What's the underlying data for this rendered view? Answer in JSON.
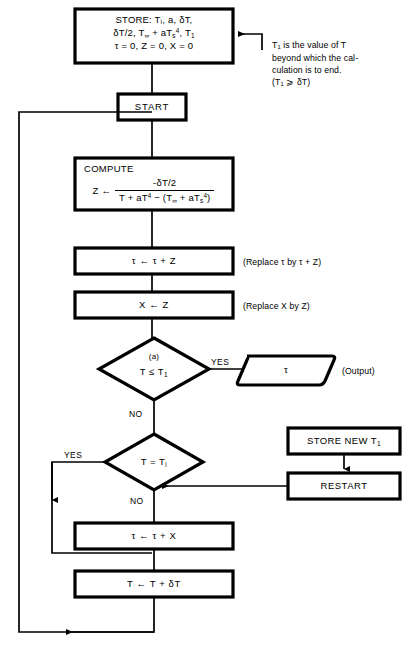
{
  "diagram": {
    "line_color": "#000000",
    "background": "#ffffff"
  },
  "nodes": {
    "store": {
      "shape": "process",
      "line1": "STORE:  Tᵢ, a, δT,",
      "line2_a": "δT/2, T",
      "line2_sub": "∞",
      "line2_b": " + aT",
      "line2_sub2": "s",
      "line2_sup": "4",
      "line2_c": ", T",
      "line2_sub3": "1",
      "line3": "τ = 0, Z = 0, X = 0"
    },
    "start": {
      "shape": "process",
      "label": "START"
    },
    "compute": {
      "shape": "process",
      "label": "COMPUTE",
      "assign_var": "Z",
      "assign_arrow": "←",
      "numerator": "-δT/2",
      "denominator_a": "T + aT",
      "denominator_sup1": "4",
      "denominator_b": " − (T",
      "denominator_sub1": "∞",
      "denominator_c": " + aT",
      "denominator_sub2": "s",
      "denominator_sup2": "4",
      "denominator_d": ")"
    },
    "tau_update": {
      "shape": "process",
      "label": "τ ← τ + Z"
    },
    "x_update": {
      "shape": "process",
      "label": "X ← Z"
    },
    "decision_a": {
      "shape": "decision",
      "marker": "(a)",
      "label_a": "T ≤ T",
      "label_sub": "1"
    },
    "output_tau": {
      "shape": "data",
      "label": "τ"
    },
    "decision_b": {
      "shape": "decision",
      "label_a": "T = T",
      "label_sub": "i"
    },
    "store_new": {
      "shape": "process",
      "label_a": "STORE NEW T",
      "label_sub": "1"
    },
    "restart": {
      "shape": "process",
      "label": "RESTART"
    },
    "tau_plus_x": {
      "shape": "process",
      "label": "τ ← τ + X"
    },
    "t_plus_dt": {
      "shape": "process",
      "label": "T ← T + δT"
    }
  },
  "edge_labels": {
    "yes_a": "YES",
    "no_a": "NO",
    "yes_b": "YES",
    "no_b": "NO"
  },
  "annotations": {
    "store_note": {
      "line1_a": "T",
      "line1_sub": "1",
      "line1_b": " is the value of T",
      "line2": "beyond which the cal-",
      "line3": "culation is to end.",
      "line4_a": "(T",
      "line4_sub": "1",
      "line4_b": " ⩾ δT)"
    },
    "replace_tau": "(Replace τ by τ + Z)",
    "replace_x": "(Replace X by Z)",
    "output_note": "(Output)"
  }
}
